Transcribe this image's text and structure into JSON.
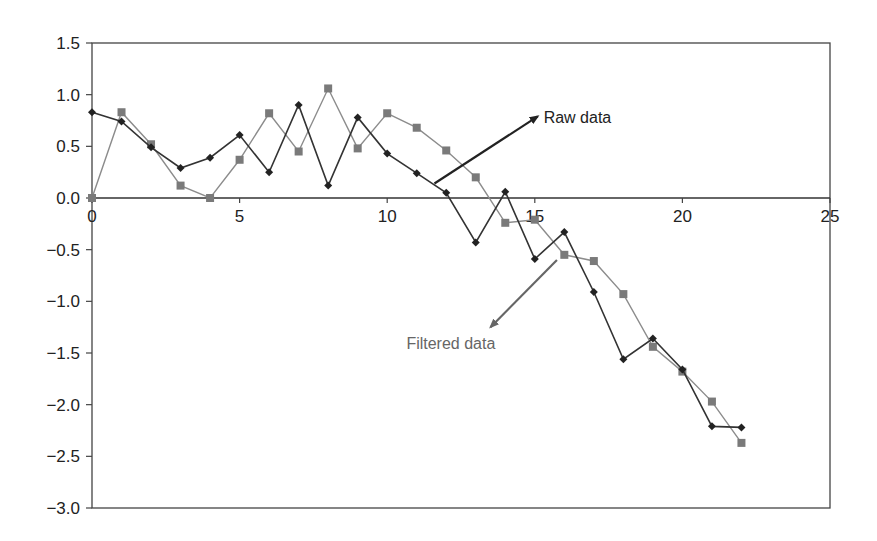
{
  "chart_data": {
    "type": "line",
    "title": "",
    "xlabel": "",
    "ylabel": "",
    "xlim": [
      0,
      25
    ],
    "ylim": [
      -3.0,
      1.5
    ],
    "x_ticks": [
      0,
      5,
      10,
      15,
      20,
      25
    ],
    "x_tick_labels": [
      "0",
      "5",
      "10",
      "15",
      "20",
      "25"
    ],
    "y_ticks": [
      1.5,
      1.0,
      0.5,
      0.0,
      -0.5,
      -1.0,
      -1.5,
      -2.0,
      -2.5,
      -3.0
    ],
    "y_tick_labels": [
      "1.5",
      "1.0",
      "0.5",
      "0.0",
      "−0.5",
      "−1.0",
      "−1.5",
      "−2.0",
      "−2.5",
      "−3.0"
    ],
    "grid": false,
    "legend": "none (inline arrow annotations)",
    "x": [
      0,
      1,
      2,
      3,
      4,
      5,
      6,
      7,
      8,
      9,
      10,
      11,
      12,
      13,
      14,
      15,
      16,
      17,
      18,
      19,
      20,
      21,
      22
    ],
    "series": [
      {
        "name": "Raw data",
        "marker": "diamond",
        "color": "#222222",
        "values": [
          0.83,
          0.74,
          0.49,
          0.29,
          0.39,
          0.61,
          0.25,
          0.9,
          0.12,
          0.78,
          0.43,
          0.24,
          0.05,
          -0.43,
          0.06,
          -0.59,
          -0.33,
          -0.91,
          -1.56,
          -1.36,
          -1.66,
          -2.21,
          -2.22
        ]
      },
      {
        "name": "Filtered data",
        "marker": "square",
        "color": "#7a7a7a",
        "values": [
          0.0,
          0.83,
          0.52,
          0.12,
          0.0,
          0.37,
          0.82,
          0.45,
          1.06,
          0.48,
          0.82,
          0.68,
          0.46,
          0.2,
          -0.24,
          -0.21,
          -0.55,
          -0.61,
          -0.93,
          -1.44,
          -1.68,
          -1.97,
          -2.37
        ]
      }
    ],
    "annotations": [
      {
        "text": "Raw data",
        "color": "#222222",
        "arrow_from": [
          11.6,
          0.14
        ],
        "arrow_to": [
          15.1,
          0.79
        ],
        "text_pos": [
          15.3,
          0.78
        ]
      },
      {
        "text": "Filtered data",
        "color": "#666666",
        "arrow_from": [
          15.75,
          -0.6
        ],
        "arrow_to": [
          13.5,
          -1.25
        ],
        "text_pos": [
          10.65,
          -1.4
        ]
      }
    ]
  }
}
